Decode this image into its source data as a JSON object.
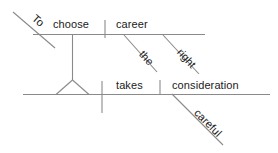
{
  "diagram": {
    "type": "reed-kellogg-sentence-diagram",
    "sentence": "To choose the right career takes careful consideration.",
    "canvas": {
      "width": 278,
      "height": 153
    },
    "line_color": "#8a8a8a",
    "text_color": "#1a1a1a",
    "words": {
      "to": "To",
      "choose": "choose",
      "career": "career",
      "the": "the",
      "right": "right",
      "takes": "takes",
      "consideration": "consideration",
      "careful": "careful"
    },
    "structure": {
      "infinitive_phrase": {
        "marker": "To",
        "verb": "choose",
        "object": "career",
        "object_modifiers": [
          "the",
          "right"
        ]
      },
      "main_clause": {
        "subject": "infinitive phrase (pedestal)",
        "verb": "takes",
        "direct_object": "consideration",
        "object_modifiers": [
          "careful"
        ]
      }
    }
  }
}
